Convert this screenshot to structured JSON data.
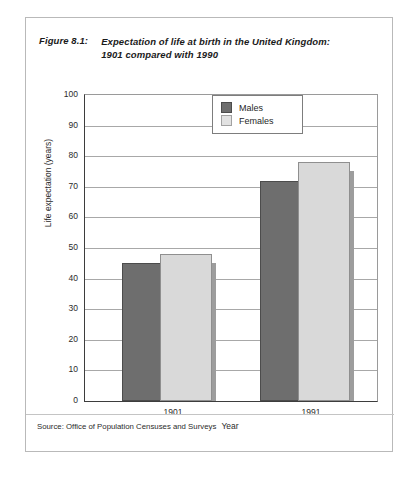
{
  "figure": {
    "label": "Figure 8.1:",
    "title_line1": "Expectation of life at birth in the United Kingdom:",
    "title_line2": "1901 compared with 1990",
    "source": "Source: Office of Population Censuses and Surveys"
  },
  "legend": {
    "items": [
      {
        "label": "Males",
        "color": "#6e6e6e"
      },
      {
        "label": "Females",
        "color": "#d9d9d9"
      }
    ]
  },
  "colors": {
    "male_bar": "#6e6e6e",
    "female_bar": "#d9d9d9",
    "shadow": "#9d9d9d",
    "axis": "#3d3d3d",
    "grid": "#a8a8a8",
    "frame": "#b9b9b9"
  },
  "chart_data": {
    "type": "bar",
    "title": "Figure 8.1: Expectation of life at birth in the United Kingdom: 1901 compared with 1990",
    "xlabel": "Year",
    "ylabel": "Life expectation (years)",
    "categories": [
      "1901",
      "1991"
    ],
    "series": [
      {
        "name": "Males",
        "values": [
          45,
          72
        ]
      },
      {
        "name": "Females",
        "values": [
          48,
          78
        ]
      }
    ],
    "ylim": [
      0,
      100
    ],
    "yticks": [
      0,
      10,
      20,
      30,
      40,
      50,
      60,
      70,
      80,
      90,
      100
    ],
    "ytick_labels": [
      "0",
      "10",
      "20",
      "30",
      "40",
      "50",
      "60",
      "70",
      "80",
      "90",
      "100"
    ],
    "grid": true,
    "legend_position": "upper center",
    "source": "Source: Office of Population Censuses and Surveys"
  }
}
